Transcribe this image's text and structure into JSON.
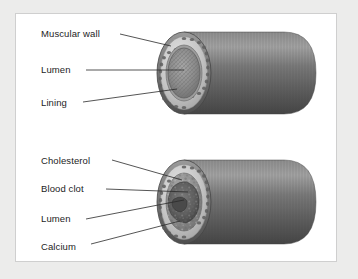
{
  "illustration": {
    "title": "Artery cross-section comparison",
    "background_color": "#ffffff",
    "mat_color": "#ececeb",
    "border_color": "#cfcfcf",
    "line_color": "#2a2a2a",
    "text_color": "#1d1d1d"
  },
  "figures": [
    {
      "id": "healthy-artery",
      "caption": "Healthy artery cut-away cylinder",
      "labels": [
        {
          "text": "Muscular wall",
          "x": 25,
          "y": 14,
          "leader": {
            "x1": 104,
            "y1": 20,
            "x2": 155,
            "y2": 32
          }
        },
        {
          "text": "Lumen",
          "x": 25,
          "y": 50,
          "leader": {
            "x1": 70,
            "y1": 56,
            "x2": 168,
            "y2": 56
          }
        },
        {
          "text": "Lining",
          "x": 25,
          "y": 83,
          "leader": {
            "x1": 67,
            "y1": 88,
            "x2": 161,
            "y2": 75
          }
        }
      ],
      "colors": {
        "tube_body": "#6f6f6f",
        "tube_body_light": "#8a8a8a",
        "tube_body_dark": "#4c4c4c",
        "outer_wall": "#7a7a7a",
        "mid_ring": "#b9b9b9",
        "speckle_ring": "#d4d4d4",
        "lining": "#9a9a9a",
        "lumen": "#8d8d8d"
      }
    },
    {
      "id": "diseased-artery",
      "caption": "Atherosclerotic artery cut-away cylinder",
      "labels": [
        {
          "text": "Cholesterol",
          "x": 25,
          "y": 13,
          "leader": {
            "x1": 96,
            "y1": 18,
            "x2": 166,
            "y2": 38
          }
        },
        {
          "text": "Blood clot",
          "x": 25,
          "y": 41,
          "leader": {
            "x1": 90,
            "y1": 47,
            "x2": 172,
            "y2": 50
          }
        },
        {
          "text": "Lumen",
          "x": 25,
          "y": 71,
          "leader": {
            "x1": 70,
            "y1": 77,
            "x2": 168,
            "y2": 58
          }
        },
        {
          "text": "Calcium",
          "x": 25,
          "y": 99,
          "leader": {
            "x1": 75,
            "y1": 102,
            "x2": 164,
            "y2": 79
          }
        }
      ],
      "colors": {
        "tube_body": "#6f6f6f",
        "tube_body_light": "#8a8a8a",
        "tube_body_dark": "#4c4c4c",
        "outer_wall": "#7a7a7a",
        "mid_ring": "#bdbdbd",
        "speckle_ring": "#d8d8d8",
        "plaque": "#9b9b9b",
        "clot": "#5d5d5d",
        "lumen_narrow": "#565656"
      }
    }
  ]
}
